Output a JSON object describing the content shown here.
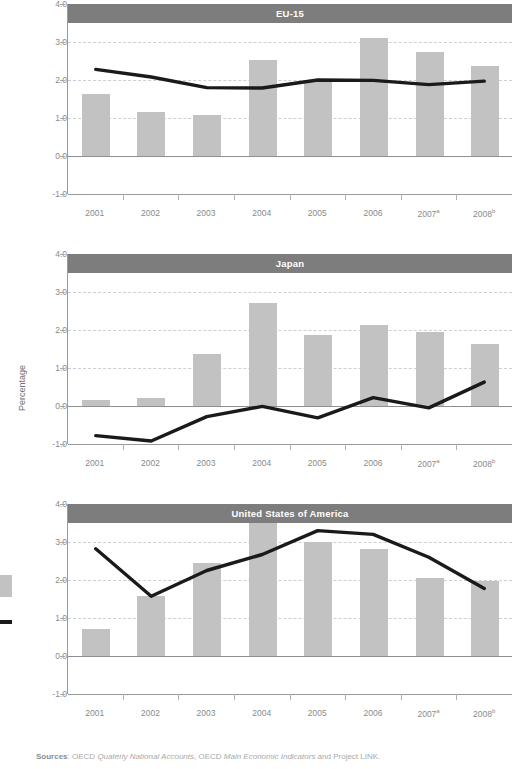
{
  "axis": {
    "y_title": "Percentage",
    "y_ticks": [
      "4.0",
      "3.0",
      "2.0",
      "1.0",
      "0.0",
      "-1.0"
    ],
    "y_values": [
      4.0,
      3.0,
      2.0,
      1.0,
      0.0,
      -1.0
    ],
    "ylim": [
      -1.0,
      4.0
    ],
    "x_labels": [
      "2001",
      "2002",
      "2003",
      "2004",
      "2005",
      "2006",
      "2007",
      "2008"
    ],
    "x_label_marks": [
      "",
      "",
      "",
      "",
      "",
      "",
      "a",
      "b"
    ]
  },
  "legend": {
    "bar_swatch_color": "#c2c2c2",
    "line_swatch_color": "#1a1a1a"
  },
  "colors": {
    "bar": "#c2c2c2",
    "line": "#1a1a1a",
    "titlebar": "#7d7d7d",
    "gridline": "#cfcfcf",
    "axis": "#9a9a9a",
    "tick_text": "#8a8a8a"
  },
  "sources": {
    "label": "Sources",
    "separator": ": ",
    "part1": "OECD ",
    "italic1": "Quaterly National Accounts",
    "part2": ", OECD ",
    "italic2": "Main Economic Indicators",
    "part3": " and Project LINK."
  },
  "chart_data": [
    {
      "type": "bar",
      "title": "EU-15",
      "xlabel": "",
      "ylabel": "Percentage",
      "ylim": [
        -1.0,
        4.0
      ],
      "grid": true,
      "categories": [
        "2001",
        "2002",
        "2003",
        "2004",
        "2005",
        "2006",
        "2007",
        "2008"
      ],
      "series": [
        {
          "name": "bars",
          "kind": "bar",
          "values": [
            1.62,
            1.15,
            1.08,
            2.52,
            1.95,
            3.1,
            2.75,
            2.38
          ]
        },
        {
          "name": "line",
          "kind": "line",
          "values": [
            2.28,
            2.08,
            1.8,
            1.79,
            2.0,
            1.99,
            1.88,
            1.97
          ]
        }
      ]
    },
    {
      "type": "bar",
      "title": "Japan",
      "xlabel": "",
      "ylabel": "Percentage",
      "ylim": [
        -1.0,
        4.0
      ],
      "grid": true,
      "categories": [
        "2001",
        "2002",
        "2003",
        "2004",
        "2005",
        "2006",
        "2007",
        "2008"
      ],
      "series": [
        {
          "name": "bars",
          "kind": "bar",
          "values": [
            0.15,
            0.22,
            1.38,
            2.7,
            1.86,
            2.14,
            1.94,
            1.64
          ]
        },
        {
          "name": "line",
          "kind": "line",
          "values": [
            -0.78,
            -0.92,
            -0.28,
            -0.01,
            -0.31,
            0.22,
            -0.05,
            0.63
          ]
        }
      ]
    },
    {
      "type": "bar",
      "title": "United States of America",
      "xlabel": "",
      "ylabel": "Percentage",
      "ylim": [
        -1.0,
        4.0
      ],
      "grid": true,
      "categories": [
        "2001",
        "2002",
        "2003",
        "2004",
        "2005",
        "2006",
        "2007",
        "2008"
      ],
      "series": [
        {
          "name": "bars",
          "kind": "bar",
          "values": [
            0.72,
            1.57,
            2.45,
            3.58,
            3.0,
            2.82,
            2.05,
            1.98
          ]
        },
        {
          "name": "line",
          "kind": "line",
          "values": [
            2.82,
            1.57,
            2.25,
            2.67,
            3.3,
            3.2,
            2.6,
            1.78
          ]
        }
      ]
    }
  ]
}
